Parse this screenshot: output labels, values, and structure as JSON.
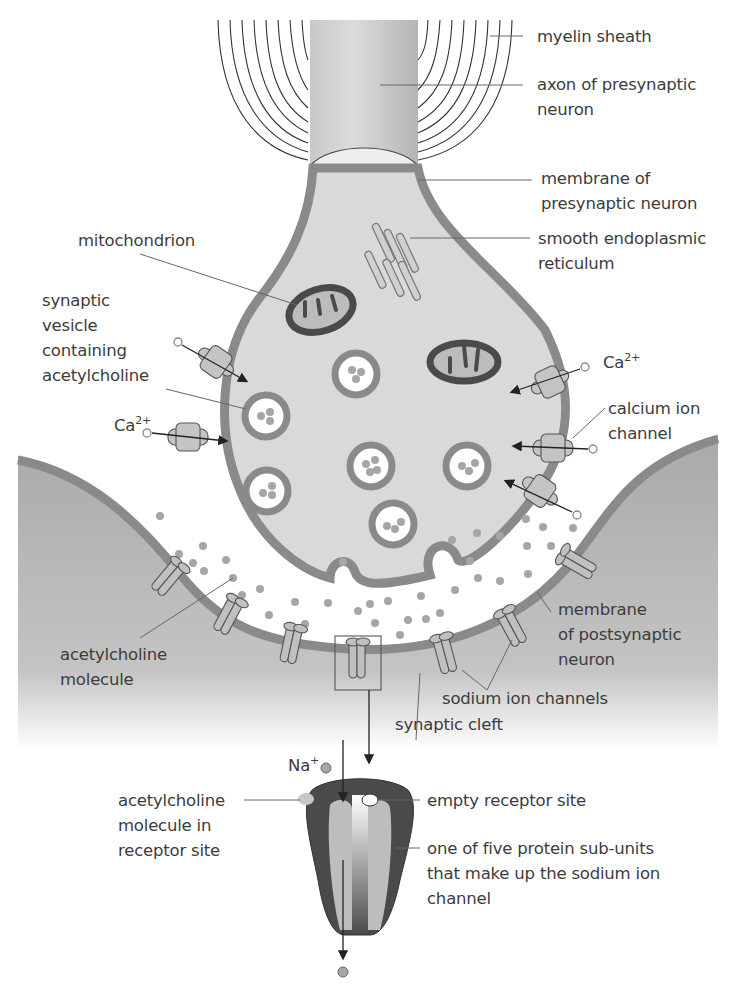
{
  "diagram": {
    "labels": {
      "myelin_sheath": "myelin sheath",
      "axon": "axon of presynaptic\nneuron",
      "presynaptic_membrane": "membrane of\npresynaptic neuron",
      "mitochondrion": "mitochondrion",
      "ser": "smooth endoplasmic\nreticulum",
      "vesicle": "synaptic\nvesicle\ncontaining\nacetylcholine",
      "ca_right": "Ca",
      "ca_left": "Ca",
      "ca_charge": "2+",
      "calcium_channel": "calcium ion\nchannel",
      "ach_molecule": "acetylcholine\nmolecule",
      "postsynaptic_membrane": "membrane\nof postsynaptic\nneuron",
      "sodium_channels": "sodium ion channels",
      "synaptic_cleft": "synaptic cleft",
      "na": "Na",
      "na_charge": "+",
      "ach_in_site": "acetylcholine\nmolecule in\nreceptor site",
      "empty_site": "empty receptor site",
      "subunit": "one of five protein sub-units\nthat make up the sodium ion\nchannel"
    },
    "colors": {
      "cytoplasm": "#d9d9d9",
      "membrane": "#8a8a8a",
      "dark": "#4a4a4a",
      "postsynaptic": "#b8b8b8",
      "molecule": "#a6a6a6"
    }
  }
}
